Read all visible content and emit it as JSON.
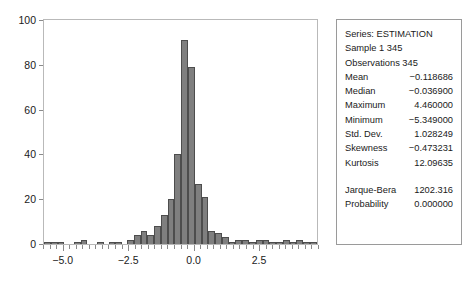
{
  "chart_data": {
    "type": "bar",
    "title": "",
    "xlabel": "",
    "ylabel": "",
    "xlim": [
      -5.75,
      4.75
    ],
    "ylim": [
      0,
      100
    ],
    "grid": false,
    "legend_position": "none",
    "bin_width": 0.25,
    "x_ticks": [
      "-5.0",
      "-2.5",
      "0.0",
      "2.5"
    ],
    "x_tick_values": [
      -5.0,
      -2.5,
      0.0,
      2.5
    ],
    "y_ticks": [
      "0",
      "20",
      "40",
      "60",
      "80",
      "100"
    ],
    "y_tick_values": [
      0,
      20,
      40,
      60,
      80,
      100
    ],
    "bin_centers": [
      -5.625,
      -5.375,
      -5.125,
      -4.875,
      -4.625,
      -4.375,
      -4.125,
      -3.875,
      -3.625,
      -3.375,
      -3.125,
      -2.875,
      -2.625,
      -2.375,
      -2.125,
      -1.875,
      -1.625,
      -1.375,
      -1.125,
      -0.875,
      -0.625,
      -0.375,
      -0.125,
      0.125,
      0.375,
      0.625,
      0.875,
      1.125,
      1.375,
      1.625,
      1.875,
      2.125,
      2.375,
      2.625,
      2.875,
      3.125,
      3.375,
      3.625,
      3.875,
      4.125,
      4.375,
      4.625
    ],
    "values": [
      1,
      1,
      1,
      0,
      0,
      1,
      2,
      0,
      0,
      1,
      0,
      1,
      1,
      0,
      2,
      4,
      6,
      4,
      8,
      13,
      20,
      40,
      91,
      79,
      27,
      21,
      6,
      5,
      3,
      1,
      2,
      2,
      1,
      2,
      2,
      1,
      1,
      2,
      1,
      2,
      1,
      1
    ],
    "bar_color": "#7f7f7f",
    "bar_edge_color": "#4d4d4d"
  },
  "stats": {
    "series_label": "Series: ESTIMATION",
    "sample_label": "Sample 1 345",
    "observations_label": "Observations 345",
    "rows": [
      {
        "key": "Mean",
        "value": "−0.118686"
      },
      {
        "key": "Median",
        "value": "−0.036900"
      },
      {
        "key": "Maximum",
        "value": "4.460000"
      },
      {
        "key": "Minimum",
        "value": "−5.349000"
      },
      {
        "key": "Std. Dev.",
        "value": "1.028249"
      },
      {
        "key": "Skewness",
        "value": "−0.473231"
      },
      {
        "key": "Kurtosis",
        "value": "12.09635"
      }
    ],
    "test_rows": [
      {
        "key": "Jarque-Bera",
        "value": "1202.316"
      },
      {
        "key": "Probability",
        "value": "0.000000"
      }
    ]
  }
}
